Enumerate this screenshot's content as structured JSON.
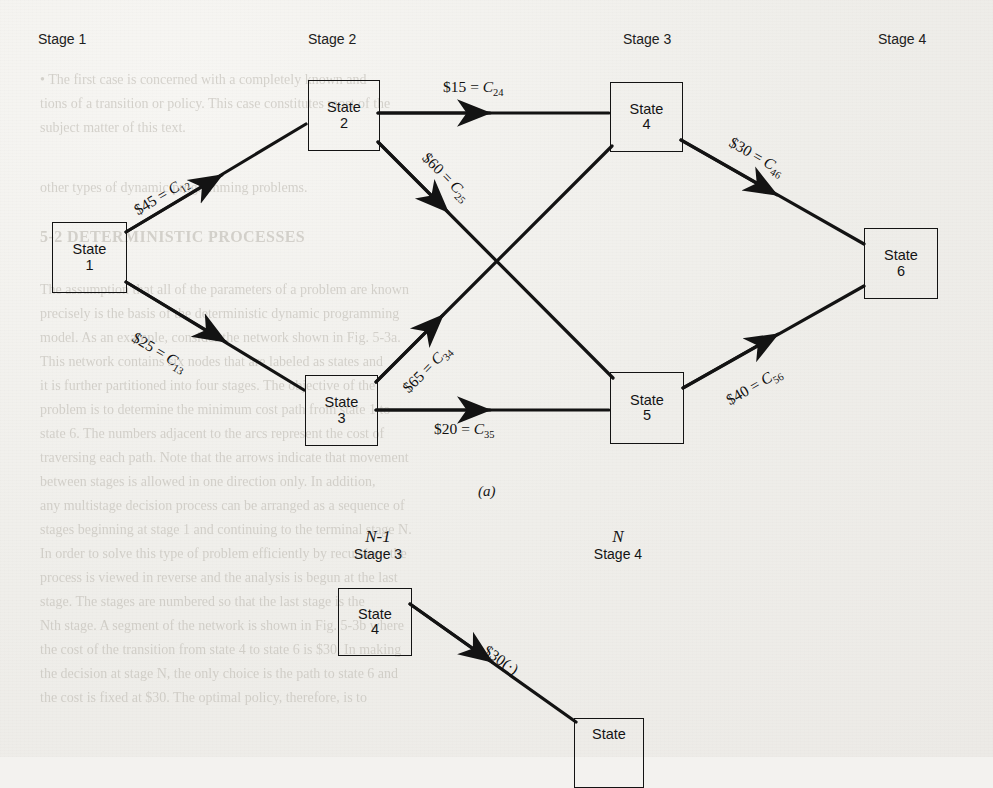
{
  "page": {
    "background_hex": "#f3f2ef",
    "ink_hex": "#131313",
    "showthrough_hex": "#b9b5ad"
  },
  "figure_a": {
    "caption": "(a)",
    "stage_headers": [
      {
        "label": "Stage 1"
      },
      {
        "label": "Stage 2"
      },
      {
        "label": "Stage 3"
      },
      {
        "label": "Stage 4"
      }
    ],
    "nodes": [
      {
        "id": "1",
        "word": "State",
        "number": "1"
      },
      {
        "id": "2",
        "word": "State",
        "number": "2"
      },
      {
        "id": "3",
        "word": "State",
        "number": "3"
      },
      {
        "id": "4",
        "word": "State",
        "number": "4"
      },
      {
        "id": "5",
        "word": "State",
        "number": "5"
      },
      {
        "id": "6",
        "word": "State",
        "number": "6"
      }
    ],
    "edges": [
      {
        "from": "1",
        "to": "2",
        "cost": "$45",
        "eq": "=",
        "sym": "C",
        "sub": "12"
      },
      {
        "from": "1",
        "to": "3",
        "cost": "$25",
        "eq": "=",
        "sym": "C",
        "sub": "13"
      },
      {
        "from": "2",
        "to": "4",
        "cost": "$15",
        "eq": "=",
        "sym": "C",
        "sub": "24"
      },
      {
        "from": "2",
        "to": "5",
        "cost": "$60",
        "eq": "=",
        "sym": "C",
        "sub": "25"
      },
      {
        "from": "3",
        "to": "4",
        "cost": "$65",
        "eq": "=",
        "sym": "C",
        "sub": "34"
      },
      {
        "from": "3",
        "to": "5",
        "cost": "$20",
        "eq": "=",
        "sym": "C",
        "sub": "35"
      },
      {
        "from": "4",
        "to": "6",
        "cost": "$30",
        "eq": "=",
        "sym": "C",
        "sub": "46"
      },
      {
        "from": "5",
        "to": "6",
        "cost": "$40",
        "eq": "=",
        "sym": "C",
        "sub": "56"
      }
    ]
  },
  "figure_b": {
    "stage_headers": [
      {
        "n": "N-1",
        "label": "Stage 3"
      },
      {
        "n": "N",
        "label": "Stage 4"
      }
    ],
    "nodes": [
      {
        "id": "4b",
        "word": "State",
        "number": "4"
      },
      {
        "id": "6b",
        "word": "State",
        "number": ""
      }
    ],
    "edges": [
      {
        "from": "4b",
        "to": "6b",
        "cost": "$30",
        "suffix": "(·)"
      }
    ]
  },
  "showthrough": [
    {
      "text": "• The first case is concerned with a completely known and",
      "x": 40,
      "y": 72,
      "size": 14,
      "bold": false
    },
    {
      "text": "tions of a transition or policy. This case constitutes most of the",
      "x": 40,
      "y": 96,
      "size": 14,
      "bold": false
    },
    {
      "text": "subject matter of this text.",
      "x": 40,
      "y": 120,
      "size": 14,
      "bold": false
    },
    {
      "text": "other types of dynamic programming problems.",
      "x": 40,
      "y": 180,
      "size": 14,
      "bold": false
    },
    {
      "text": "5-2  DETERMINISTIC PROCESSES",
      "x": 40,
      "y": 228,
      "size": 16,
      "bold": true
    },
    {
      "text": "The assumption that all of the parameters of a problem are known",
      "x": 40,
      "y": 282,
      "size": 14,
      "bold": false
    },
    {
      "text": "precisely is the basis of the deterministic dynamic programming",
      "x": 40,
      "y": 306,
      "size": 14,
      "bold": false
    },
    {
      "text": "model. As an example, consider the network shown in Fig. 5-3a.",
      "x": 40,
      "y": 330,
      "size": 14,
      "bold": false
    },
    {
      "text": "This network contains six nodes that are labeled as states and",
      "x": 40,
      "y": 354,
      "size": 14,
      "bold": false
    },
    {
      "text": "it is further partitioned into four stages. The objective of the",
      "x": 40,
      "y": 378,
      "size": 14,
      "bold": false
    },
    {
      "text": "problem is to determine the minimum cost path from state 1 to",
      "x": 40,
      "y": 402,
      "size": 14,
      "bold": false
    },
    {
      "text": "state 6. The numbers adjacent to the arcs represent the cost of",
      "x": 40,
      "y": 426,
      "size": 14,
      "bold": false
    },
    {
      "text": "traversing each path. Note that the arrows indicate that movement",
      "x": 40,
      "y": 450,
      "size": 14,
      "bold": false
    },
    {
      "text": "between stages is allowed in one direction only. In addition,",
      "x": 40,
      "y": 474,
      "size": 14,
      "bold": false
    },
    {
      "text": "any multistage decision process can be arranged as a sequence of",
      "x": 40,
      "y": 498,
      "size": 14,
      "bold": false
    },
    {
      "text": "stages beginning at stage 1 and continuing to the terminal stage N.",
      "x": 40,
      "y": 522,
      "size": 14,
      "bold": false
    },
    {
      "text": "In order to solve this type of problem efficiently by recursion, the",
      "x": 40,
      "y": 546,
      "size": 14,
      "bold": false
    },
    {
      "text": "process is viewed in reverse and the analysis is begun at the last",
      "x": 40,
      "y": 570,
      "size": 14,
      "bold": false
    },
    {
      "text": "stage. The stages are numbered so that the last stage is the",
      "x": 40,
      "y": 594,
      "size": 14,
      "bold": false
    },
    {
      "text": "Nth stage. A segment of the network is shown in Fig. 5-3b where",
      "x": 40,
      "y": 618,
      "size": 14,
      "bold": false
    },
    {
      "text": "the cost of the transition from state 4 to state 6 is $30. In making",
      "x": 40,
      "y": 642,
      "size": 14,
      "bold": false
    },
    {
      "text": "the decision at stage N, the only choice is the path to state 6 and",
      "x": 40,
      "y": 666,
      "size": 14,
      "bold": false
    },
    {
      "text": "the cost is fixed at $30. The optimal policy, therefore, is to",
      "x": 40,
      "y": 690,
      "size": 14,
      "bold": false
    }
  ]
}
